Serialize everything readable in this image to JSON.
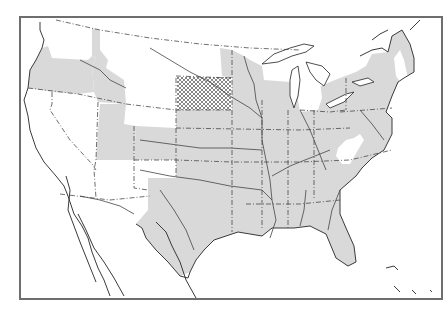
{
  "map": {
    "type": "thematic-distribution-map",
    "region": "United States",
    "legend_visible": false,
    "colors": {
      "shaded": "#d9d9d9",
      "hatched": "#8c8c8c",
      "unshaded": "#ffffff",
      "frame": "#6e6e6e"
    },
    "regions": {
      "shaded": [
        "Oregon",
        "Idaho",
        "Utah",
        "Colorado",
        "Nebraska",
        "Kansas",
        "Oklahoma",
        "Texas",
        "Minnesota",
        "Wisconsin",
        "Iowa",
        "Missouri",
        "Arkansas",
        "Louisiana",
        "Illinois",
        "Indiana",
        "Ohio",
        "Kentucky",
        "Tennessee",
        "Mississippi",
        "Alabama",
        "Georgia",
        "Florida",
        "Pennsylvania",
        "New York",
        "Maine",
        "Massachusetts",
        "Connecticut",
        "New Jersey",
        "Maryland",
        "Virginia",
        "North Carolina"
      ],
      "hatched": [
        "South Dakota"
      ],
      "unshaded": [
        "Washington",
        "California",
        "Nevada",
        "Arizona",
        "New Mexico",
        "Montana",
        "Wyoming",
        "North Dakota",
        "Michigan",
        "West Virginia",
        "South Carolina",
        "Vermont",
        "New Hampshire"
      ]
    }
  }
}
